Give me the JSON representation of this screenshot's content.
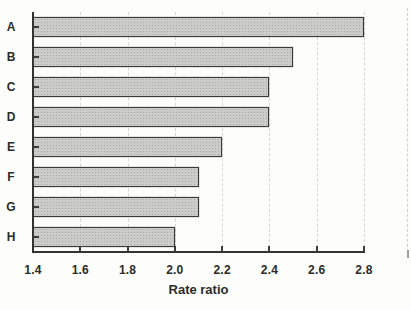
{
  "figure": {
    "background": "#fdfdfc",
    "axis_color": "#333331",
    "text_color": "#2b2b29",
    "grid_color": "#d3d9d1",
    "bar_fill": "#cccccb",
    "bar_border": "#3a3a38"
  },
  "chart_data": {
    "type": "bar",
    "orientation": "horizontal",
    "title": "",
    "categories": [
      "A",
      "B",
      "C",
      "D",
      "E",
      "F",
      "G",
      "H"
    ],
    "values": [
      2.8,
      2.5,
      2.4,
      2.4,
      2.2,
      2.1,
      2.1,
      2.0
    ],
    "xlabel": "Rate ratio",
    "ylabel": "",
    "xlim": [
      1.4,
      2.8
    ],
    "x_ticks": [
      "1.4",
      "1.6",
      "1.8",
      "2.0",
      "2.2",
      "2.4",
      "2.6",
      "2.8"
    ],
    "x_tick_values": [
      1.4,
      1.6,
      1.8,
      2.0,
      2.2,
      2.4,
      2.6,
      2.8
    ],
    "grid": "vertical dashed gridlines at each x tick",
    "legend": "none"
  }
}
